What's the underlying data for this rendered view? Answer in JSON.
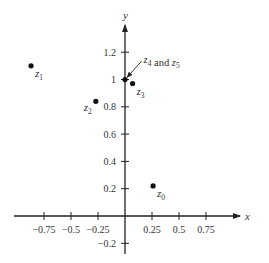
{
  "chart_data": {
    "type": "scatter",
    "title": "",
    "xlabel": "x",
    "ylabel": "y",
    "xlim": [
      -1.0,
      1.05
    ],
    "ylim": [
      -0.25,
      1.4
    ],
    "grid": false,
    "x_ticks": [
      -0.75,
      -0.5,
      -0.25,
      0.25,
      0.5,
      0.75
    ],
    "x_tick_labels": [
      "−0.75",
      "−0.5",
      "−0.25",
      "0.25",
      "0.5",
      "0.75"
    ],
    "y_ticks": [
      -0.2,
      0.2,
      0.4,
      0.6,
      0.8,
      1,
      1.2
    ],
    "y_tick_labels": [
      "−0.2",
      "0.2",
      "0.4",
      "0.6",
      "0.8",
      "1",
      "1.2"
    ],
    "points": [
      {
        "name": "z",
        "sub": "0",
        "x": 0.26,
        "y": 0.22,
        "label_pos": "below-right"
      },
      {
        "name": "z",
        "sub": "1",
        "x": -0.87,
        "y": 1.1,
        "label_pos": "below-right"
      },
      {
        "name": "z",
        "sub": "2",
        "x": -0.27,
        "y": 0.84,
        "label_pos": "below-left"
      },
      {
        "name": "z",
        "sub": "3",
        "x": 0.07,
        "y": 0.97,
        "label_pos": "below-right"
      },
      {
        "name": "z",
        "sub": "4",
        "x": 0.0,
        "y": 1.0,
        "label_pos": "none"
      },
      {
        "name": "z",
        "sub": "5",
        "x": 0.0,
        "y": 1.0,
        "label_pos": "none"
      }
    ],
    "annotations": [
      {
        "parts": [
          {
            "t": "z",
            "i": true
          },
          {
            "t": "4",
            "sub": true
          },
          {
            "t": " and ",
            "i": false
          },
          {
            "t": "z",
            "i": true
          },
          {
            "t": "5",
            "sub": true
          }
        ],
        "target": [
          0.0,
          1.0
        ],
        "text_near": [
          0.2,
          1.12
        ]
      }
    ]
  }
}
